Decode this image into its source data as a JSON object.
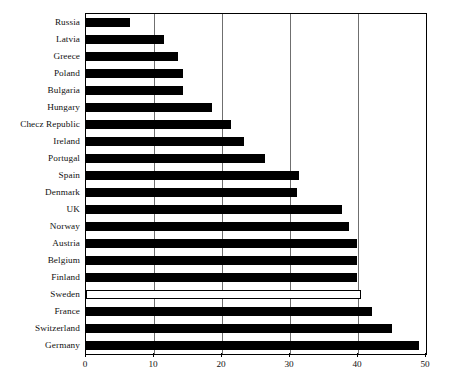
{
  "chart_data": {
    "type": "bar",
    "orientation": "horizontal",
    "title": "",
    "subtitle": "",
    "xlabel": "",
    "ylabel": "",
    "xlim": [
      0,
      50
    ],
    "ylim": null,
    "grid": "vertical",
    "legend": null,
    "xticks": [
      0,
      10,
      20,
      30,
      40,
      50
    ],
    "xticklabels": [
      "0",
      "10",
      "20",
      "30",
      "40",
      "50"
    ],
    "categories": [
      "Russia",
      "Latvia",
      "Greece",
      "Poland",
      "Bulgaria",
      "Hungary",
      "Checz Republic",
      "Ireland",
      "Portugal",
      "Spain",
      "Denmark",
      "UK",
      "Norway",
      "Austria",
      "Belgium",
      "Finland",
      "Sweden",
      "France",
      "Switzerland",
      "Germany"
    ],
    "values": [
      6.4,
      11.5,
      13.5,
      14.3,
      14.3,
      18.5,
      21.3,
      23.3,
      26.3,
      31.3,
      31.0,
      37.7,
      38.7,
      39.8,
      39.8,
      39.8,
      40.5,
      42.0,
      45.0,
      49.0
    ],
    "bar_styles": [
      "filled",
      "filled",
      "filled",
      "filled",
      "filled",
      "filled",
      "filled",
      "filled",
      "filled",
      "filled",
      "filled",
      "filled",
      "filled",
      "filled",
      "filled",
      "filled",
      "hollow",
      "filled",
      "filled",
      "filled"
    ],
    "colors": {
      "bar_fill": "#000000",
      "bar_hollow_fill": "#ffffff",
      "bar_outline": "#000000",
      "gridline": "#6f6f6f",
      "axis": "#000000",
      "plot_background": "#ffffff",
      "text": "#111111"
    }
  }
}
